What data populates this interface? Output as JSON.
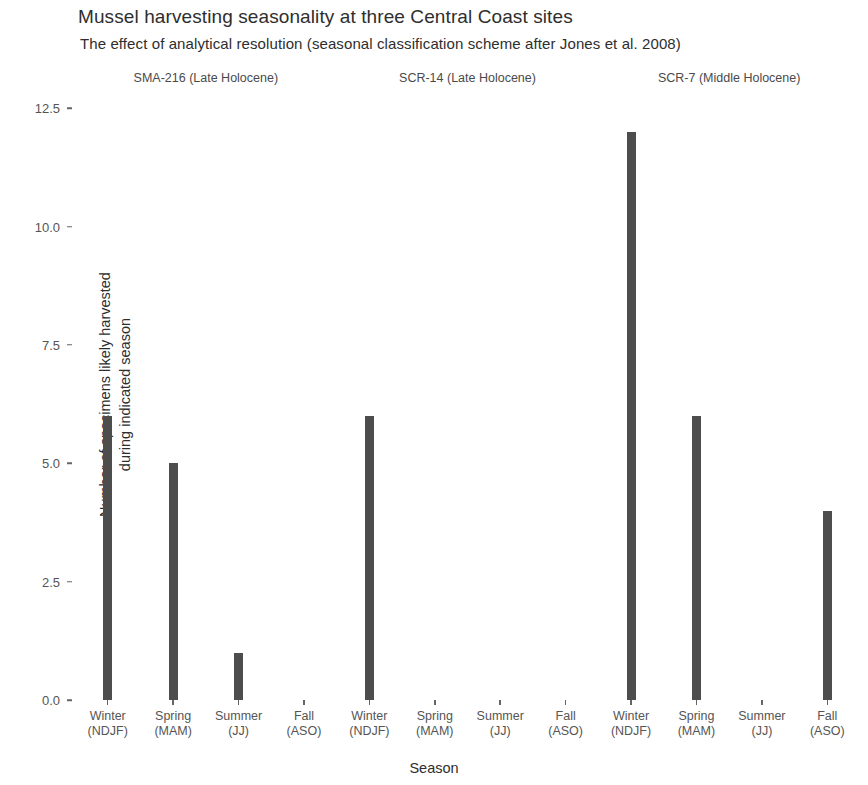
{
  "chart_data": {
    "type": "bar",
    "title": "Mussel harvesting seasonality at three Central Coast sites",
    "subtitle": "The effect of analytical resolution (seasonal classification scheme after Jones et al. 2008)",
    "xlabel": "Season",
    "ylabel_line1": "Number of specimens likely harvested",
    "ylabel_line2": "during indicated season",
    "ylim": [
      0,
      12.8
    ],
    "ytick_labels": [
      "0.0",
      "2.5",
      "5.0",
      "7.5",
      "10.0",
      "12.5"
    ],
    "ytick_values": [
      0,
      2.5,
      5,
      7.5,
      10,
      12.5
    ],
    "grid": false,
    "legend": "none",
    "bar_color": "#4d4d4d",
    "panel_background": "#ffffff",
    "categories": [
      "Winter (NDJF)",
      "Spring (MAM)",
      "Summer (JJ)",
      "Fall (ASO)"
    ],
    "category_lines": [
      {
        "l1": "Winter",
        "l2": "(NDJF)"
      },
      {
        "l1": "Spring",
        "l2": "(MAM)"
      },
      {
        "l1": "Summer",
        "l2": "(JJ)"
      },
      {
        "l1": "Fall",
        "l2": "(ASO)"
      }
    ],
    "facet_variable": "site",
    "facets": [
      {
        "label": "SMA-216 (Late Holocene)",
        "categories": [
          "Winter (NDJF)",
          "Spring (MAM)",
          "Summer (JJ)",
          "Fall (ASO)"
        ],
        "values": [
          6,
          5,
          1,
          0
        ]
      },
      {
        "label": "SCR-14 (Late Holocene)",
        "categories": [
          "Winter (NDJF)",
          "Spring (MAM)",
          "Summer (JJ)",
          "Fall (ASO)"
        ],
        "values": [
          6,
          0,
          0,
          0
        ]
      },
      {
        "label": "SCR-7 (Middle Holocene)",
        "categories": [
          "Winter (NDJF)",
          "Spring (MAM)",
          "Summer (JJ)",
          "Fall (ASO)"
        ],
        "values": [
          12,
          6,
          0,
          4
        ]
      }
    ]
  }
}
